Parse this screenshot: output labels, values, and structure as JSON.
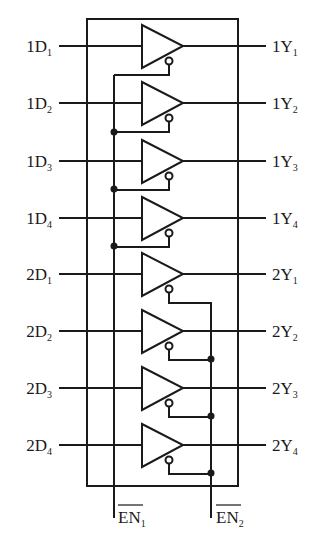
{
  "diagram": {
    "colors": {
      "stroke": "#1a1a1a",
      "background": "#ffffff"
    },
    "inputs": [
      {
        "prefix": "1D",
        "sub": "1"
      },
      {
        "prefix": "1D",
        "sub": "2"
      },
      {
        "prefix": "1D",
        "sub": "3"
      },
      {
        "prefix": "1D",
        "sub": "4"
      },
      {
        "prefix": "2D",
        "sub": "1"
      },
      {
        "prefix": "2D",
        "sub": "2"
      },
      {
        "prefix": "2D",
        "sub": "3"
      },
      {
        "prefix": "2D",
        "sub": "4"
      }
    ],
    "outputs": [
      {
        "prefix": "1Y",
        "sub": "1"
      },
      {
        "prefix": "1Y",
        "sub": "2"
      },
      {
        "prefix": "1Y",
        "sub": "3"
      },
      {
        "prefix": "1Y",
        "sub": "4"
      },
      {
        "prefix": "2Y",
        "sub": "1"
      },
      {
        "prefix": "2Y",
        "sub": "2"
      },
      {
        "prefix": "2Y",
        "sub": "3"
      },
      {
        "prefix": "2Y",
        "sub": "4"
      }
    ],
    "enables": [
      {
        "prefix": "EN",
        "sub": "1",
        "overbar": true
      },
      {
        "prefix": "EN",
        "sub": "2",
        "overbar": true
      }
    ]
  }
}
